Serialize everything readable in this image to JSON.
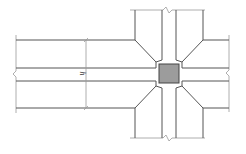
{
  "diagram": {
    "type": "beam-column joint plan view",
    "dimension_label": "h",
    "colors": {
      "line": "#555555",
      "extension_line": "#9a9a9a",
      "column_fill": "#9c9c9c",
      "column_stroke": "#444444"
    }
  }
}
